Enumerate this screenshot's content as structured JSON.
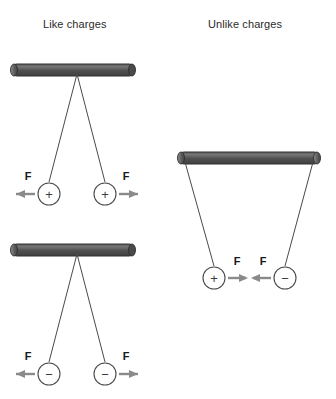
{
  "figure": {
    "background_color": "#ffffff",
    "line_color": "#4a4a4a",
    "arrow_color": "#8a8a8a",
    "bar_color_dark": "#4e4e4e",
    "bar_color_light": "#6e6e6e",
    "text_color": "#2b2b2b"
  },
  "panels": [
    {
      "id": "like-charges",
      "title": "Like charges",
      "diagrams": [
        {
          "id": "like-positive",
          "charges": [
            {
              "sign": "+",
              "force_label": "F",
              "force_direction": "left"
            },
            {
              "sign": "+",
              "force_label": "F",
              "force_direction": "right"
            }
          ],
          "behavior": "repel"
        },
        {
          "id": "like-negative",
          "charges": [
            {
              "sign": "−",
              "force_label": "F",
              "force_direction": "left"
            },
            {
              "sign": "−",
              "force_label": "F",
              "force_direction": "right"
            }
          ],
          "behavior": "repel"
        }
      ]
    },
    {
      "id": "unlike-charges",
      "title": "Unlike charges",
      "diagrams": [
        {
          "id": "unlike-pair",
          "charges": [
            {
              "sign": "+",
              "force_label": "F",
              "force_direction": "right"
            },
            {
              "sign": "−",
              "force_label": "F",
              "force_direction": "left"
            }
          ],
          "behavior": "attract"
        }
      ]
    }
  ]
}
